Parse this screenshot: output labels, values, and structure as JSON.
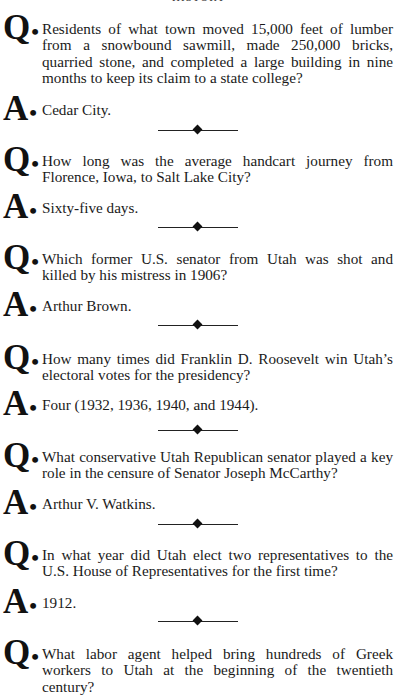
{
  "page": {
    "header": "HISTORY",
    "items": [
      {
        "question": "Residents of what town moved 15,000 feet of lumber from a snowbound sawmill, made 250,000 bricks, quarried stone, and completed a large building in nine months to keep its claim to a state college?",
        "answer": "Cedar City."
      },
      {
        "question": "How long was the average handcart journey from Florence, Iowa, to Salt Lake City?",
        "answer": "Sixty-five days."
      },
      {
        "question": "Which former U.S. senator from Utah was shot and killed by his mistress in 1906?",
        "answer": "Arthur Brown."
      },
      {
        "question": "How many times did Franklin D. Roosevelt win Utah’s electoral votes for the presidency?",
        "answer": "Four (1932, 1936, 1940, and 1944)."
      },
      {
        "question": "What conservative Utah Republican senator played a key role in the censure of Senator Joseph McCarthy?",
        "answer": "Arthur V. Watkins."
      },
      {
        "question": "In what year did Utah elect two representatives to the U.S. House of Representatives for the first time?",
        "answer": "1912."
      },
      {
        "question": "What labor agent helped bring hundreds of Greek workers to Utah at the beginning of the twentieth century?"
      }
    ]
  },
  "labels": {
    "q": "Q",
    "a": "A",
    "dot": "•"
  }
}
